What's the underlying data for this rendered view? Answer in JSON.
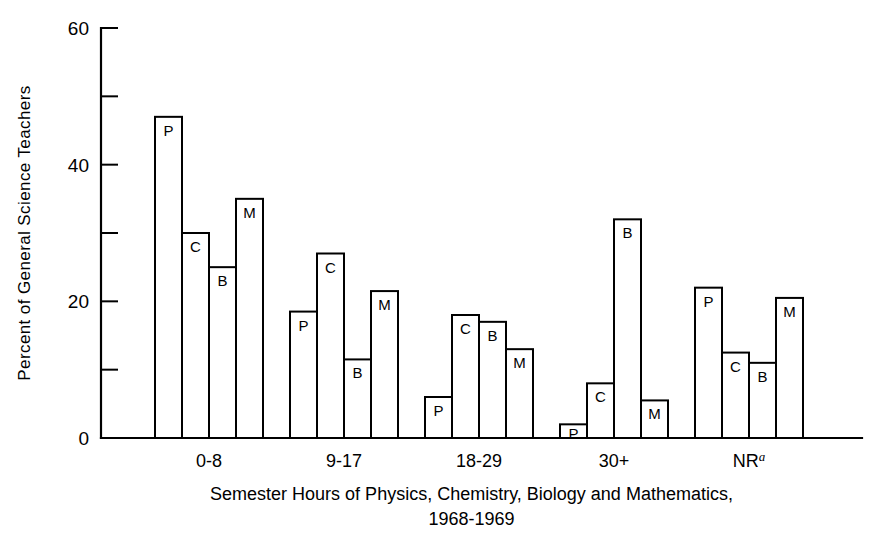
{
  "chart_data": {
    "type": "bar",
    "title": "",
    "subtitle": "",
    "xlabel": "Semester Hours of Physics, Chemistry, Biology and Mathematics,",
    "xlabel_line2": "1968-1969",
    "ylabel": "Percent of General Science Teachers",
    "ylim": [
      0,
      60
    ],
    "yticks_major": [
      0,
      20,
      40,
      60
    ],
    "yticks_minor": [
      10,
      30,
      50
    ],
    "ytick_labels": [
      "0",
      "20",
      "40",
      "60"
    ],
    "grid": false,
    "legend": "none",
    "bar_value_labels_inside": true,
    "categories": [
      "0-8",
      "9-17",
      "18-29",
      "30+",
      "NR"
    ],
    "category_superscripts": [
      "",
      "",
      "",
      "",
      "a"
    ],
    "series": [
      {
        "name": "P",
        "label": "P",
        "subject": "Physics",
        "values": [
          47,
          18.5,
          6,
          2,
          22
        ]
      },
      {
        "name": "C",
        "label": "C",
        "subject": "Chemistry",
        "values": [
          30,
          27,
          18,
          8,
          12.5
        ]
      },
      {
        "name": "B",
        "label": "B",
        "subject": "Biology",
        "values": [
          25,
          11.5,
          17,
          32,
          11
        ]
      },
      {
        "name": "M",
        "label": "M",
        "subject": "Mathematics",
        "values": [
          35,
          21.5,
          13,
          5.5,
          20.5
        ]
      }
    ]
  },
  "geometry": {
    "plot_left": 101,
    "plot_right": 862,
    "plot_top": 28,
    "plot_bottom": 438,
    "bar_width": 27,
    "group_gap": 27,
    "first_bar_x": 155
  }
}
